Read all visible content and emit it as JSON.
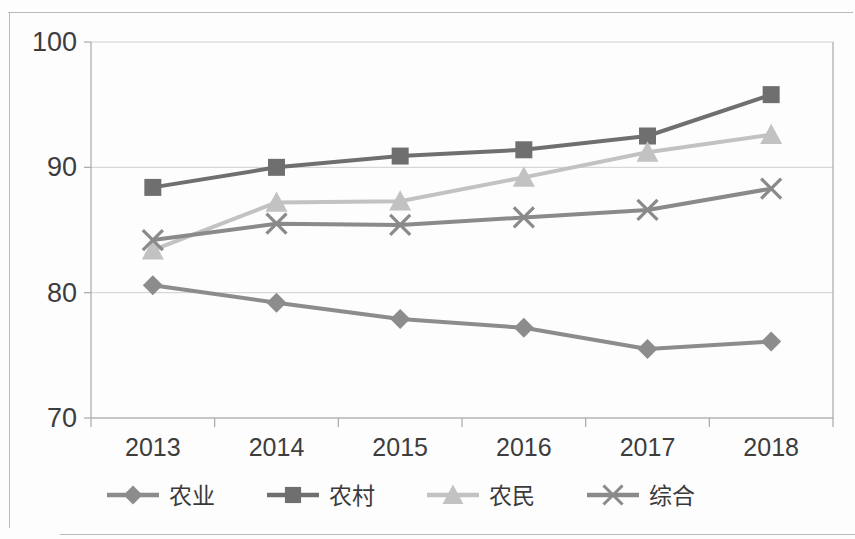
{
  "chart_data": {
    "type": "line",
    "title": "",
    "subtitle": "",
    "xlabel": "",
    "ylabel": "",
    "categories": [
      "2013",
      "2014",
      "2015",
      "2016",
      "2017",
      "2018"
    ],
    "x_tick_labels": [
      "2013",
      "2014",
      "2015",
      "2016",
      "2017",
      "2018"
    ],
    "y_tick_labels": [
      "70",
      "80",
      "90",
      "100"
    ],
    "y_ticks": [
      70,
      80,
      90,
      100
    ],
    "ylim": [
      70,
      100
    ],
    "grid": "horizontal",
    "legend_position": "bottom",
    "series": [
      {
        "name": "农业",
        "marker": "diamond",
        "color": "#8c8c8c",
        "values": [
          80.6,
          79.2,
          77.9,
          77.2,
          75.5,
          76.1
        ]
      },
      {
        "name": "农村",
        "marker": "square",
        "color": "#6f6f6f",
        "values": [
          88.4,
          90.0,
          90.9,
          91.4,
          92.5,
          95.8
        ]
      },
      {
        "name": "农民",
        "marker": "triangle",
        "color": "#c2c2c2",
        "values": [
          83.4,
          87.2,
          87.3,
          89.2,
          91.2,
          92.6
        ]
      },
      {
        "name": "综合",
        "marker": "cross",
        "color": "#8a8a8a",
        "values": [
          84.2,
          85.5,
          85.4,
          86.0,
          86.6,
          88.3
        ]
      }
    ]
  },
  "legend": {
    "items": [
      {
        "label": "农业",
        "marker": "diamond",
        "color": "#8c8c8c"
      },
      {
        "label": "农村",
        "marker": "square",
        "color": "#6f6f6f"
      },
      {
        "label": "农民",
        "marker": "triangle",
        "color": "#c2c2c2"
      },
      {
        "label": "综合",
        "marker": "cross",
        "color": "#8a8a8a"
      }
    ]
  },
  "axis": {
    "gridline_color": "#cfcfcf",
    "axis_color": "#a8a8a8",
    "text_color": "#3d3d3d"
  }
}
